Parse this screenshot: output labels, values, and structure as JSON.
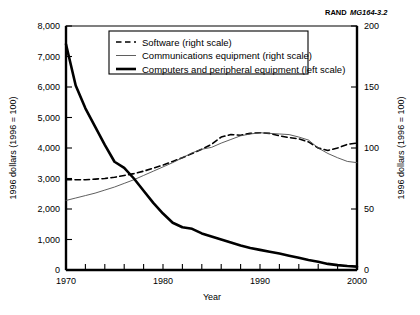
{
  "figure": {
    "id_prefix": "RAND",
    "id_suffix": "MG164-3.2"
  },
  "chart_data": {
    "type": "line",
    "title": "",
    "xlabel": "Year",
    "ylabel": "1996 dollars (1996 = 100)",
    "y2label": "1996 dollars (1996 = 100)",
    "xlim": [
      1970,
      2000
    ],
    "ylim": [
      0,
      8000
    ],
    "y2lim": [
      0,
      200
    ],
    "xticks": [
      1970,
      1980,
      1990,
      2000
    ],
    "xticklabels": [
      "1970",
      "1980",
      "1990",
      "2000"
    ],
    "xminorticks": [
      1972,
      1974,
      1976,
      1978,
      1982,
      1984,
      1986,
      1988,
      1992,
      1994,
      1996,
      1998
    ],
    "yticks": [
      0,
      1000,
      2000,
      3000,
      4000,
      5000,
      6000,
      7000,
      8000
    ],
    "yticklabels": [
      "0",
      "1,000",
      "2,000",
      "3,000",
      "4,000",
      "5,000",
      "6,000",
      "7,000",
      "8,000"
    ],
    "y2ticks": [
      0,
      50,
      100,
      150,
      200
    ],
    "y2ticklabels": [
      "0",
      "50",
      "100",
      "150",
      "200"
    ],
    "grid": false,
    "legend_position": "upper-center",
    "series": [
      {
        "name": "Software (right scale)",
        "axis": "right",
        "style": "dashed",
        "width": 1.6,
        "color": "#000000",
        "x": [
          1970,
          1971,
          1972,
          1973,
          1974,
          1975,
          1976,
          1977,
          1978,
          1979,
          1980,
          1981,
          1982,
          1983,
          1984,
          1985,
          1986,
          1987,
          1988,
          1989,
          1990,
          1991,
          1992,
          1993,
          1994,
          1995,
          1996,
          1997,
          1998,
          1999,
          2000
        ],
        "values": [
          74,
          74,
          74,
          74.5,
          75,
          76,
          77.5,
          79,
          81,
          83.5,
          86,
          89,
          92,
          95.5,
          99,
          103,
          109,
          111,
          110.5,
          112,
          112.5,
          112,
          110,
          108.5,
          107.5,
          105,
          100,
          98,
          100,
          103,
          104
        ]
      },
      {
        "name": "Communications equipment (right scale)",
        "axis": "right",
        "style": "solid",
        "width": 0.9,
        "color": "#4d4d4d",
        "x": [
          1970,
          1971,
          1972,
          1973,
          1974,
          1975,
          1976,
          1977,
          1978,
          1979,
          1980,
          1981,
          1982,
          1983,
          1984,
          1985,
          1986,
          1987,
          1988,
          1989,
          1990,
          1991,
          1992,
          1993,
          1994,
          1995,
          1996,
          1997,
          1998,
          1999,
          2000
        ],
        "values": [
          57,
          59,
          61,
          63,
          65.5,
          68,
          71,
          74,
          77.5,
          81,
          84.5,
          88,
          92,
          96,
          99,
          100.5,
          104,
          107,
          110,
          111.5,
          112.5,
          112,
          111.5,
          111,
          109,
          106.5,
          100,
          95.5,
          92,
          89,
          88
        ]
      },
      {
        "name": "Computers and peripheral equipment (left scale)",
        "axis": "left",
        "style": "solid",
        "width": 2.6,
        "color": "#000000",
        "x": [
          1970,
          1971,
          1972,
          1973,
          1974,
          1975,
          1976,
          1977,
          1978,
          1979,
          1980,
          1981,
          1982,
          1983,
          1984,
          1985,
          1986,
          1987,
          1988,
          1989,
          1990,
          1991,
          1992,
          1993,
          1994,
          1995,
          1996,
          1997,
          1998,
          1999,
          2000
        ],
        "values": [
          7400,
          6050,
          5300,
          4700,
          4100,
          3550,
          3350,
          3000,
          2600,
          2200,
          1850,
          1550,
          1400,
          1350,
          1200,
          1100,
          1000,
          900,
          800,
          720,
          660,
          600,
          540,
          470,
          400,
          330,
          270,
          200,
          160,
          130,
          110
        ]
      }
    ]
  },
  "legend": {
    "items": [
      {
        "label": "Software (right scale)",
        "style": "dashed",
        "width": 1.6,
        "color": "#000000"
      },
      {
        "label": "Communications equipment (right scale)",
        "style": "solid",
        "width": 0.9,
        "color": "#4d4d4d"
      },
      {
        "label": "Computers and peripheral equipment (left scale)",
        "style": "solid",
        "width": 2.6,
        "color": "#000000"
      }
    ]
  }
}
